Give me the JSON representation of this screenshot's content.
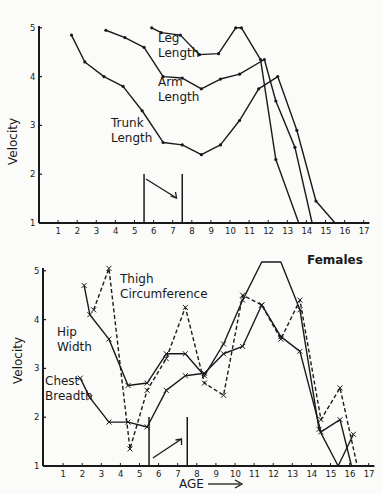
{
  "chart_data": [
    {
      "type": "line",
      "panel": "top",
      "title": "",
      "xlabel": "",
      "ylabel": "Velocity",
      "xlim": [
        0,
        17
      ],
      "ylim": [
        1,
        5
      ],
      "xticks": [
        1,
        2,
        3,
        4,
        5,
        6,
        7,
        8,
        9,
        10,
        11,
        12,
        13,
        14,
        15,
        16,
        17
      ],
      "yticks": [
        1,
        2,
        3,
        4,
        5
      ],
      "grid": false,
      "annotation": {
        "type": "arrow-down-right",
        "bracket_x": [
          5.5,
          7.5
        ]
      },
      "series": [
        {
          "name": "Leg Length",
          "marker": "dot",
          "style": "solid",
          "x": [
            5.9,
            6.4,
            7.4,
            8.4,
            9.4,
            10.3,
            10.6,
            11.6,
            12.4,
            13.6
          ],
          "y": [
            5.0,
            4.9,
            4.85,
            4.45,
            4.47,
            5.0,
            5.0,
            4.35,
            2.3,
            1.0
          ]
        },
        {
          "name": "Arm Length",
          "marker": "dot",
          "style": "solid",
          "x": [
            3.5,
            4.5,
            5.5,
            6.5,
            7.5,
            8.5,
            9.5,
            10.5,
            11.8,
            12.4,
            13.4,
            14.3
          ],
          "y": [
            4.95,
            4.8,
            4.6,
            4.0,
            3.97,
            3.75,
            3.95,
            4.05,
            4.35,
            3.5,
            2.55,
            1.0
          ]
        },
        {
          "name": "Trunk Length",
          "marker": "dot",
          "style": "solid",
          "x": [
            1.7,
            2.4,
            3.4,
            4.4,
            5.4,
            6.5,
            7.5,
            8.5,
            9.5,
            10.5,
            11.5,
            12.5,
            13.5,
            14.5,
            15.5
          ],
          "y": [
            4.85,
            4.3,
            4.0,
            3.8,
            3.3,
            2.65,
            2.6,
            2.4,
            2.6,
            3.1,
            3.75,
            4.0,
            2.9,
            1.45,
            1.0
          ]
        }
      ]
    },
    {
      "type": "line",
      "panel": "bottom",
      "title": "Females",
      "xlabel": "AGE",
      "ylabel": "Velocity",
      "xlim": [
        0,
        17
      ],
      "ylim": [
        1,
        5
      ],
      "xticks": [
        1,
        2,
        3,
        4,
        5,
        6,
        7,
        8,
        9,
        10,
        11,
        12,
        13,
        14,
        15,
        16,
        17
      ],
      "yticks": [
        1,
        2,
        3,
        4,
        5
      ],
      "grid": false,
      "annotation": {
        "type": "arrow-up-right",
        "bracket_x": [
          5.5,
          7.5
        ]
      },
      "series": [
        {
          "name": "Thigh Circumference",
          "marker": "x",
          "style": "dashed",
          "x": [
            2.6,
            3.4,
            4.5,
            5.4,
            6.4,
            7.4,
            8.4,
            9.4,
            10.4,
            11.4,
            12.4,
            13.4,
            14.5,
            15.5,
            16.4
          ],
          "y": [
            4.2,
            5.05,
            1.35,
            2.55,
            3.2,
            4.25,
            2.7,
            2.45,
            4.5,
            4.3,
            3.6,
            4.4,
            1.95,
            2.6,
            1.0
          ]
        },
        {
          "name": "Hip Width",
          "marker": "x",
          "style": "solid",
          "x": [
            2.1,
            2.4,
            3.4,
            4.4,
            5.4,
            6.4,
            7.4,
            8.4,
            9.4,
            10.4,
            11.4,
            12.4,
            13.4,
            14.4,
            15.4,
            16.2
          ],
          "y": [
            4.7,
            4.1,
            3.6,
            2.65,
            2.7,
            3.3,
            3.3,
            2.85,
            3.5,
            4.4,
            5.3,
            5.2,
            4.2,
            1.75,
            1.0,
            1.65
          ]
        },
        {
          "name": "Chest Breadth",
          "marker": "x",
          "style": "solid",
          "x": [
            1.9,
            2.4,
            3.4,
            4.4,
            5.4,
            6.4,
            7.4,
            8.4,
            9.4,
            10.4,
            11.4,
            12.4,
            13.4,
            14.5,
            15.5,
            16.1
          ],
          "y": [
            2.8,
            2.4,
            1.9,
            1.9,
            1.8,
            2.55,
            2.85,
            2.9,
            3.3,
            3.45,
            4.3,
            3.65,
            3.35,
            1.7,
            1.95,
            1.0
          ]
        }
      ]
    }
  ],
  "labels": {
    "top_ylabel": "Velocity",
    "bottom_ylabel": "Velocity",
    "leg_length_1": "Leg",
    "leg_length_2": "Length",
    "arm_length_1": "Arm",
    "arm_length_2": "Length",
    "trunk_length_1": "Trunk",
    "trunk_length_2": "Length",
    "thigh_1": "Thigh",
    "thigh_2": "Circumference",
    "hip_1": "Hip",
    "hip_2": "Width",
    "chest_1": "Chest",
    "chest_2": "Breadth",
    "females": "Females",
    "age": "AGE"
  }
}
